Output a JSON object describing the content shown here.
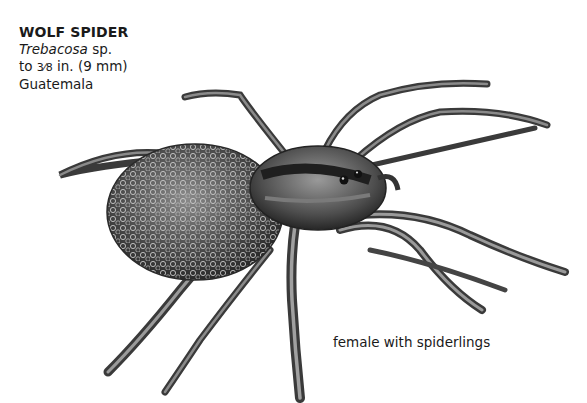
{
  "caption": {
    "title": "WOLF SPIDER",
    "genus": "Trebacosa",
    "species_suffix": " sp.",
    "size_prefix": "to ",
    "size_fraction": "3⁄8",
    "size_rest": " in. (9 mm)",
    "location": "Guatemala"
  },
  "illustration": {
    "subject": "wolf-spider-illustration",
    "note": "female with spiderlings",
    "colors": {
      "ink": "#2a2a2a",
      "mid": "#6b6b6b",
      "light": "#a8a8a8",
      "background": "#ffffff"
    }
  }
}
